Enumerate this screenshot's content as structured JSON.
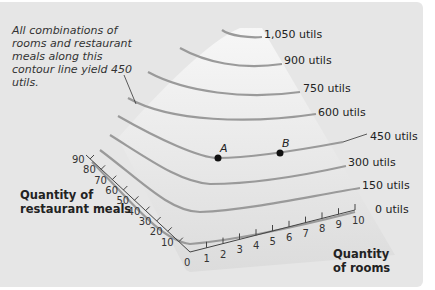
{
  "annotation": "All combinations of rooms and restaurant meals along this contour line yield 450 utils.",
  "axes": {
    "meals_title_line1": "Quantity of",
    "meals_title_line2": "restaurant meals",
    "rooms_title_line1": "Quantity",
    "rooms_title_line2": "of rooms",
    "meals_ticks": [
      "0",
      "10",
      "20",
      "30",
      "40",
      "50",
      "60",
      "70",
      "80",
      "90"
    ],
    "rooms_ticks": [
      "1",
      "2",
      "3",
      "4",
      "5",
      "6",
      "7",
      "8",
      "9",
      "10"
    ]
  },
  "contours": [
    {
      "label": "1,050 utils",
      "value": 1050
    },
    {
      "label": "900 utils",
      "value": 900
    },
    {
      "label": "750 utils",
      "value": 750
    },
    {
      "label": "600 utils",
      "value": 600
    },
    {
      "label": "450 utils",
      "value": 450
    },
    {
      "label": "300 utils",
      "value": 300
    },
    {
      "label": "150 utils",
      "value": 150
    },
    {
      "label": "0 utils",
      "value": 0
    }
  ],
  "points": [
    {
      "label": "A",
      "contour": 450
    },
    {
      "label": "B",
      "contour": 450
    }
  ],
  "colors": {
    "background": "#e6e6e6",
    "surface": "#f4f4f4",
    "contour": "#9a9a9a",
    "ink": "#222222"
  }
}
